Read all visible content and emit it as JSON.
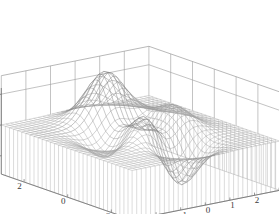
{
  "figure": {
    "name": "peaks-surface-mesh-plot",
    "background": "#ffffff",
    "mesh_color": "#8c8c8c",
    "skirt_color": "#b9b9b9",
    "grid_color": "#9a9a9a",
    "axis_color": "#6f6f6f",
    "label_color": "#3a3a3a"
  },
  "chart_data": {
    "type": "surface",
    "title": "",
    "subtitle": "",
    "xlabel": "",
    "ylabel": "",
    "zlabel": "",
    "function": "peaks",
    "formula": "z = 3*(1-x)^2*exp(-x^2-(y+1)^2) - 10*(x/5 - x^3 - y^5)*exp(-x^2-y^2) - (1/3)*exp(-(x+1)^2 - y^2)",
    "x": {
      "label": "",
      "min": -3,
      "max": 3,
      "ticks": [
        -3,
        -2,
        -1,
        0,
        1,
        2,
        3
      ],
      "tick_labels": [
        "-3",
        "-2",
        "-1",
        "0",
        "1",
        "2",
        "3"
      ]
    },
    "y": {
      "label": "",
      "min": -3,
      "max": 3,
      "ticks": [
        2,
        0,
        -2
      ],
      "tick_labels": [
        "2",
        "0",
        "-2"
      ]
    },
    "z": {
      "label": "",
      "min": -8,
      "max": 8,
      "ticks": [
        5,
        0,
        -5
      ],
      "tick_labels": [
        "5",
        "0",
        "-5"
      ]
    },
    "grid": true,
    "legend": null,
    "mesh_resolution": 33,
    "skirt": true,
    "skirt_base_z": -8,
    "peak_max_value": 8.1,
    "peak_min_value": -6.5,
    "view_azimuth": -37.5,
    "view_elevation": 30,
    "annotations": []
  },
  "axes": {
    "z_ticks": [
      {
        "value": 5,
        "label": "5"
      },
      {
        "value": 0,
        "label": "0"
      },
      {
        "value": -5,
        "label": "-5"
      }
    ],
    "y_ticks": [
      {
        "value": 2,
        "label": "2"
      },
      {
        "value": 0,
        "label": "0"
      },
      {
        "value": -2,
        "label": "-2"
      }
    ],
    "x_ticks": [
      {
        "value": -3,
        "label": "-3"
      },
      {
        "value": -2,
        "label": "-2"
      },
      {
        "value": -1,
        "label": "-1"
      },
      {
        "value": 0,
        "label": "0"
      },
      {
        "value": 1,
        "label": "1"
      },
      {
        "value": 2,
        "label": "2"
      },
      {
        "value": 3,
        "label": "3"
      }
    ]
  }
}
